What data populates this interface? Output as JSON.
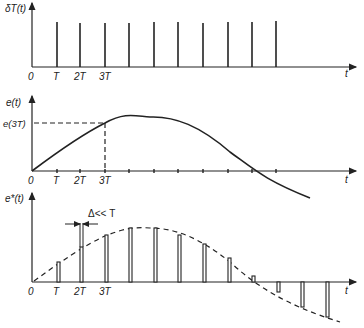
{
  "panels": [
    {
      "id": "sampling-impulse-train",
      "y_label": "δT(t)",
      "x_label": "t",
      "tick_labels": [
        "0",
        "T",
        "2T",
        "3T"
      ]
    },
    {
      "id": "continuous-signal",
      "y_label": "e(t)",
      "x_label": "t",
      "tick_labels": [
        "0",
        "T",
        "2T",
        "3T"
      ],
      "marker_label": "e(3T)"
    },
    {
      "id": "sampled-signal",
      "y_label": "e*(t)",
      "x_label": "t",
      "tick_labels": [
        "0",
        "T",
        "2T",
        "3T"
      ],
      "annotation": "Δ<< T"
    }
  ]
}
